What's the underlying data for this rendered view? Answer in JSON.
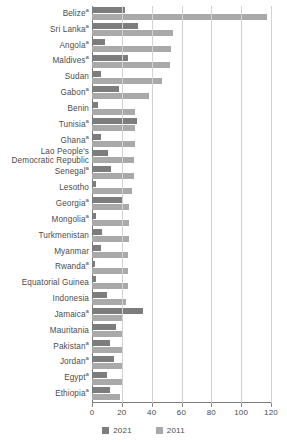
{
  "chart_data": {
    "type": "bar",
    "orientation": "horizontal",
    "title": "",
    "xlabel": "",
    "ylabel": "",
    "xlim": [
      0,
      120
    ],
    "xticks": [
      0,
      20,
      40,
      60,
      80,
      100,
      120
    ],
    "grid": true,
    "legend_position": "bottom-center",
    "categories": [
      "Belizeᵃ",
      "Sri Lankaᵃ",
      "Angolaᵃ",
      "Maldivesᵃ",
      "Sudan",
      "Gabonᵃ",
      "Benin",
      "Tunisiaᵃ",
      "Ghanaᵃ",
      "Lao People's\nDemocratic Republic",
      "Senegalᵃ",
      "Lesotho",
      "Georgiaᵃ",
      "Mongoliaᵃ",
      "Turkmenistan",
      "Myanmar",
      "Rwandaᵃ",
      "Equatorial Guinea",
      "Indonesia",
      "Jamaicaᵃ",
      "Mauritania",
      "Pakistanᵃ",
      "Jordanᵃ",
      "Egyptᵃ",
      "Ethiopiaᵃ"
    ],
    "series": [
      {
        "name": "2021",
        "color": "#7d7d7d",
        "values": [
          22,
          31,
          9,
          24,
          6,
          18,
          4,
          30,
          6,
          11,
          13,
          3,
          20,
          3,
          7,
          6,
          2,
          3,
          10,
          34,
          16,
          12,
          15,
          10,
          12
        ]
      },
      {
        "name": "2011",
        "color": "#a9a9a9",
        "values": [
          117,
          54,
          53,
          52,
          47,
          38,
          29,
          29,
          29,
          28,
          28,
          27,
          25,
          25,
          25,
          24,
          24,
          24,
          23,
          21,
          21,
          21,
          21,
          21,
          19
        ]
      }
    ]
  },
  "legend": {
    "items": [
      {
        "label": "2021",
        "color": "#7d7d7d"
      },
      {
        "label": "2011",
        "color": "#a9a9a9"
      }
    ]
  },
  "axis": {
    "tick_labels": [
      "0",
      "20",
      "40",
      "60",
      "80",
      "100",
      "120"
    ]
  }
}
